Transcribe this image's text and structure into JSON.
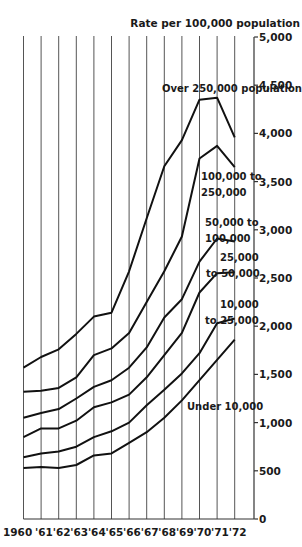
{
  "chart_data": {
    "type": "line",
    "title": "",
    "ylabel": "Rate per 100,000 population",
    "xlabel": "",
    "x": [
      "1960",
      "'61",
      "'62",
      "'63",
      "'64",
      "'65",
      "'66",
      "'67",
      "'68",
      "'69",
      "'70",
      "'71",
      "'72"
    ],
    "ylim": [
      0,
      5000
    ],
    "yticks": [
      0,
      500,
      1000,
      1500,
      2000,
      2500,
      3000,
      3500,
      4000,
      4500,
      5000
    ],
    "ytick_labels": [
      "0",
      "500",
      "1,000",
      "1,500",
      "2,000",
      "2,500",
      "3,000",
      "3,500",
      "4,000",
      "4,500",
      "5,000"
    ],
    "grid": "vertical lines at each year",
    "legend": "inline labels beside each line",
    "series": [
      {
        "name": "Over 250,000 population",
        "label_lines": [
          "Over 250,000 population"
        ],
        "values": [
          1570,
          1680,
          1760,
          1920,
          2100,
          2140,
          2570,
          3120,
          3660,
          3930,
          4350,
          4370,
          3960
        ]
      },
      {
        "name": "100,000 to 250,000",
        "label_lines": [
          "100,000 to",
          "250,000"
        ],
        "values": [
          1320,
          1330,
          1360,
          1470,
          1700,
          1770,
          1930,
          2250,
          2570,
          2930,
          3740,
          3870,
          3650
        ]
      },
      {
        "name": "50,000 to 100,000",
        "label_lines": [
          "50,000 to",
          "100,000"
        ],
        "values": [
          1050,
          1100,
          1140,
          1250,
          1370,
          1440,
          1570,
          1780,
          2090,
          2280,
          2670,
          2910,
          2880
        ]
      },
      {
        "name": "25,000 to 50,000",
        "label_lines": [
          "25,000",
          "to 50,000"
        ],
        "values": [
          850,
          940,
          940,
          1020,
          1160,
          1210,
          1290,
          1470,
          1700,
          1930,
          2350,
          2550,
          2560
        ]
      },
      {
        "name": "10,000 to 25,000",
        "label_lines": [
          "10,000",
          "to 25,000"
        ],
        "values": [
          640,
          680,
          700,
          750,
          850,
          910,
          1000,
          1180,
          1340,
          1510,
          1720,
          2030,
          2080
        ]
      },
      {
        "name": "Under 10,000",
        "label_lines": [
          "Under 10,000"
        ],
        "values": [
          530,
          540,
          530,
          560,
          660,
          680,
          790,
          900,
          1050,
          1230,
          1440,
          1650,
          1860
        ]
      }
    ]
  }
}
